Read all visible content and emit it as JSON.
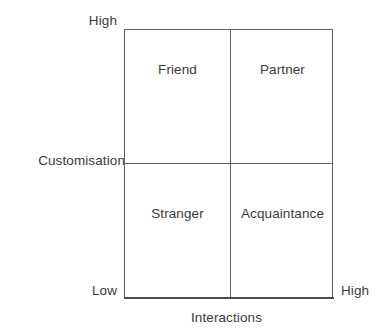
{
  "diagram": {
    "type": "2x2 matrix",
    "y_axis": {
      "title": "Customisation",
      "high_label": "High",
      "low_label": "Low"
    },
    "x_axis": {
      "title": "Interactions",
      "high_label": "High"
    },
    "quadrants": {
      "top_left": "Friend",
      "top_right": "Partner",
      "bottom_left": "Stranger",
      "bottom_right": "Acquaintance"
    }
  },
  "chart_data": {
    "type": "scatter",
    "title": "",
    "xlabel": "Interactions",
    "ylabel": "Customisation",
    "grid": true,
    "legend": null,
    "x_tick_labels": [
      "",
      "High"
    ],
    "y_tick_labels": [
      "Low",
      "High"
    ],
    "cells": [
      {
        "label": "Friend",
        "x": "low",
        "y": "high"
      },
      {
        "label": "Partner",
        "x": "high",
        "y": "high"
      },
      {
        "label": "Stranger",
        "x": "low",
        "y": "low"
      },
      {
        "label": "Acquaintance",
        "x": "high",
        "y": "low"
      }
    ]
  }
}
